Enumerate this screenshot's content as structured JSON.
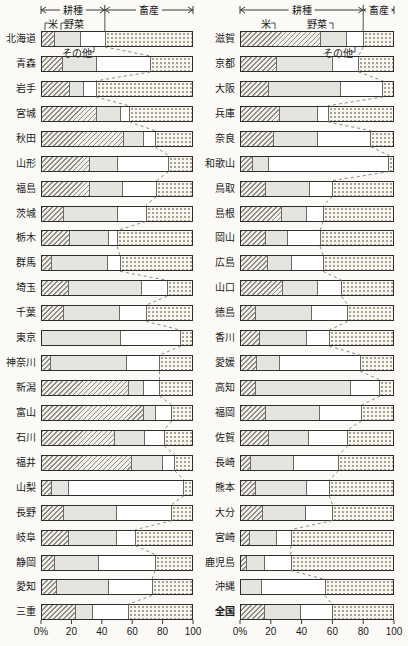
{
  "chart_data": {
    "type": "bar",
    "orientation": "horizontal-stacked",
    "unit": "%",
    "xlim": [
      0,
      100
    ],
    "grid": false,
    "group_labels": {
      "crops": "耕種",
      "livestock": "畜産"
    },
    "series_labels": {
      "rice": "米",
      "vegetables": "野菜",
      "others": "その他",
      "livestock": "畜産"
    },
    "x_ticks": [
      "0%",
      "20",
      "40",
      "60",
      "80",
      "100"
    ],
    "columns": [
      {
        "rows": [
          {
            "name": "北海道",
            "rice": 8,
            "vegetables": 17,
            "others": 17,
            "livestock": 58
          },
          {
            "name": "青森",
            "rice": 13,
            "vegetables": 23,
            "others": 36,
            "livestock": 28
          },
          {
            "name": "岩手",
            "rice": 18,
            "vegetables": 9,
            "others": 9,
            "livestock": 64
          },
          {
            "name": "宮城",
            "rice": 36,
            "vegetables": 16,
            "others": 6,
            "livestock": 42
          },
          {
            "name": "秋田",
            "rice": 54,
            "vegetables": 13,
            "others": 8,
            "livestock": 25
          },
          {
            "name": "山形",
            "rice": 31,
            "vegetables": 19,
            "others": 34,
            "livestock": 16
          },
          {
            "name": "福島",
            "rice": 31,
            "vegetables": 22,
            "others": 23,
            "livestock": 24
          },
          {
            "name": "茨城",
            "rice": 14,
            "vegetables": 36,
            "others": 19,
            "livestock": 31
          },
          {
            "name": "栃木",
            "rice": 18,
            "vegetables": 26,
            "others": 6,
            "livestock": 50
          },
          {
            "name": "群馬",
            "rice": 6,
            "vegetables": 37,
            "others": 9,
            "livestock": 48
          },
          {
            "name": "埼玉",
            "rice": 17,
            "vegetables": 49,
            "others": 17,
            "livestock": 17
          },
          {
            "name": "千葉",
            "rice": 14,
            "vegetables": 37,
            "others": 18,
            "livestock": 31
          },
          {
            "name": "東京",
            "rice": 0,
            "vegetables": 52,
            "others": 40,
            "livestock": 8
          },
          {
            "name": "神奈川",
            "rice": 5,
            "vegetables": 51,
            "others": 22,
            "livestock": 22
          },
          {
            "name": "新潟",
            "rice": 57,
            "vegetables": 10,
            "others": 11,
            "livestock": 22
          },
          {
            "name": "富山",
            "rice": 67,
            "vegetables": 8,
            "others": 11,
            "livestock": 14
          },
          {
            "name": "石川",
            "rice": 48,
            "vegetables": 20,
            "others": 13,
            "livestock": 19
          },
          {
            "name": "福井",
            "rice": 59,
            "vegetables": 21,
            "others": 8,
            "livestock": 12
          },
          {
            "name": "山梨",
            "rice": 6,
            "vegetables": 11,
            "others": 77,
            "livestock": 6
          },
          {
            "name": "長野",
            "rice": 14,
            "vegetables": 35,
            "others": 37,
            "livestock": 14
          },
          {
            "name": "岐阜",
            "rice": 17,
            "vegetables": 32,
            "others": 13,
            "livestock": 38
          },
          {
            "name": "静岡",
            "rice": 8,
            "vegetables": 29,
            "others": 38,
            "livestock": 25
          },
          {
            "name": "愛知",
            "rice": 9,
            "vegetables": 35,
            "others": 29,
            "livestock": 27
          },
          {
            "name": "三重",
            "rice": 22,
            "vegetables": 11,
            "others": 24,
            "livestock": 43
          }
        ]
      },
      {
        "rows": [
          {
            "name": "滋賀",
            "rice": 52,
            "vegetables": 17,
            "others": 11,
            "livestock": 20
          },
          {
            "name": "京都",
            "rice": 23,
            "vegetables": 37,
            "others": 17,
            "livestock": 23
          },
          {
            "name": "大阪",
            "rice": 18,
            "vegetables": 47,
            "others": 28,
            "livestock": 7
          },
          {
            "name": "兵庫",
            "rice": 25,
            "vegetables": 25,
            "others": 7,
            "livestock": 43
          },
          {
            "name": "奈良",
            "rice": 21,
            "vegetables": 29,
            "others": 35,
            "livestock": 15
          },
          {
            "name": "和歌山",
            "rice": 7,
            "vegetables": 11,
            "others": 79,
            "livestock": 3
          },
          {
            "name": "鳥取",
            "rice": 16,
            "vegetables": 29,
            "others": 15,
            "livestock": 40
          },
          {
            "name": "島根",
            "rice": 26,
            "vegetables": 17,
            "others": 11,
            "livestock": 46
          },
          {
            "name": "岡山",
            "rice": 16,
            "vegetables": 14,
            "others": 22,
            "livestock": 48
          },
          {
            "name": "広島",
            "rice": 17,
            "vegetables": 16,
            "others": 21,
            "livestock": 46
          },
          {
            "name": "山口",
            "rice": 27,
            "vegetables": 23,
            "others": 16,
            "livestock": 34
          },
          {
            "name": "徳島",
            "rice": 9,
            "vegetables": 37,
            "others": 24,
            "livestock": 30
          },
          {
            "name": "香川",
            "rice": 12,
            "vegetables": 31,
            "others": 15,
            "livestock": 42
          },
          {
            "name": "愛媛",
            "rice": 10,
            "vegetables": 15,
            "others": 53,
            "livestock": 22
          },
          {
            "name": "高知",
            "rice": 9,
            "vegetables": 63,
            "others": 19,
            "livestock": 9
          },
          {
            "name": "福岡",
            "rice": 16,
            "vegetables": 35,
            "others": 28,
            "livestock": 21
          },
          {
            "name": "佐賀",
            "rice": 18,
            "vegetables": 26,
            "others": 26,
            "livestock": 30
          },
          {
            "name": "長崎",
            "rice": 6,
            "vegetables": 28,
            "others": 30,
            "livestock": 36
          },
          {
            "name": "熊本",
            "rice": 9,
            "vegetables": 34,
            "others": 15,
            "livestock": 42
          },
          {
            "name": "大分",
            "rice": 14,
            "vegetables": 28,
            "others": 18,
            "livestock": 40
          },
          {
            "name": "宮崎",
            "rice": 5,
            "vegetables": 18,
            "others": 10,
            "livestock": 67
          },
          {
            "name": "鹿児島",
            "rice": 3,
            "vegetables": 12,
            "others": 18,
            "livestock": 67
          },
          {
            "name": "沖縄",
            "rice": 0,
            "vegetables": 13,
            "others": 42,
            "livestock": 45
          },
          {
            "name": "全国",
            "rice": 15,
            "vegetables": 24,
            "others": 21,
            "livestock": 40,
            "bold": true
          }
        ]
      }
    ]
  },
  "colors": {
    "border": "#2e2e2e",
    "hatch_line": "#8e8c85",
    "hatch_bg": "#f2f0ea",
    "veg": "#e6e4de",
    "dots": "#a6a396",
    "dots_bg": "#f7f5ee",
    "dashed": "#8a8a8a",
    "text": "#1a1a1a"
  }
}
